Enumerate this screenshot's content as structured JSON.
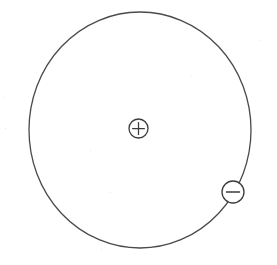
{
  "figure": {
    "background_color": "#ffffff",
    "width": 277,
    "height": 265
  },
  "chart_data": {
    "type": "diagram",
    "title": "Atom model: nucleus with orbiting electron",
    "background": "#ffffff",
    "stroke_color": "#4a4a4a",
    "elements": [
      {
        "name": "electron-orbit",
        "shape": "ellipse",
        "cx": 140,
        "cy": 130,
        "rx": 111,
        "ry": 118,
        "stroke": "#4a4a4a",
        "stroke_width": 1.3,
        "fill": "none"
      },
      {
        "name": "nucleus",
        "shape": "circle",
        "label": "+",
        "cx": 138.5,
        "cy": 128.5,
        "r": 9.5,
        "stroke": "#3c3c3c",
        "stroke_width": 1.3,
        "fill": "#ffffff"
      },
      {
        "name": "electron",
        "shape": "circle",
        "label": "−",
        "cx": 233,
        "cy": 192,
        "r": 11,
        "stroke": "#3c3c3c",
        "stroke_width": 1.3,
        "fill": "#ffffff"
      }
    ]
  },
  "labels": {
    "nucleus_charge": "+",
    "electron_charge": "−"
  },
  "colors": {
    "stroke": "#4a4a4a",
    "particle_stroke": "#3c3c3c",
    "background": "#ffffff"
  }
}
